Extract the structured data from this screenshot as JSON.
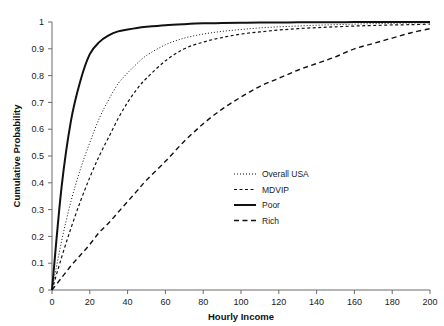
{
  "chart_data": {
    "type": "line",
    "title": "",
    "xlabel": "Hourly Income",
    "ylabel": "Cumulative Probability",
    "xlim": [
      0,
      200
    ],
    "ylim": [
      0,
      1
    ],
    "grid": false,
    "legend_position": "center-right",
    "xticks": [
      "0",
      "20",
      "40",
      "60",
      "80",
      "100",
      "120",
      "140",
      "160",
      "180",
      "200"
    ],
    "xtick_values": [
      0,
      20,
      40,
      60,
      80,
      100,
      120,
      140,
      160,
      180,
      200
    ],
    "yticks": [
      "0",
      "0.1",
      "0.2",
      "0.3",
      "0.4",
      "0.5",
      "0.6",
      "0.7",
      "0.8",
      "0.9",
      "1"
    ],
    "ytick_values": [
      0,
      0.1,
      0.2,
      0.3,
      0.4,
      0.5,
      0.6,
      0.7,
      0.8,
      0.9,
      1
    ],
    "x": [
      0,
      5,
      10,
      15,
      20,
      25,
      30,
      35,
      40,
      45,
      50,
      60,
      70,
      80,
      90,
      100,
      110,
      120,
      130,
      140,
      150,
      160,
      170,
      180,
      190,
      200
    ],
    "series": [
      {
        "name": "Overall USA",
        "style": "dotted",
        "color": "#111111",
        "width": 1.0,
        "values": [
          0,
          0.18,
          0.33,
          0.45,
          0.55,
          0.64,
          0.71,
          0.77,
          0.81,
          0.845,
          0.875,
          0.915,
          0.94,
          0.955,
          0.965,
          0.972,
          0.978,
          0.982,
          0.985,
          0.988,
          0.99,
          0.992,
          0.994,
          0.995,
          0.996,
          0.997
        ]
      },
      {
        "name": "MDVIP",
        "style": "dashed-short",
        "color": "#111111",
        "width": 1.2,
        "values": [
          0,
          0.12,
          0.23,
          0.33,
          0.42,
          0.5,
          0.57,
          0.64,
          0.7,
          0.75,
          0.79,
          0.855,
          0.9,
          0.925,
          0.942,
          0.955,
          0.963,
          0.97,
          0.975,
          0.979,
          0.982,
          0.985,
          0.987,
          0.989,
          0.99,
          0.992
        ]
      },
      {
        "name": "Poor",
        "style": "solid",
        "color": "#111111",
        "width": 2.0,
        "values": [
          0,
          0.38,
          0.63,
          0.78,
          0.88,
          0.925,
          0.95,
          0.965,
          0.972,
          0.978,
          0.982,
          0.988,
          0.992,
          0.995,
          0.996,
          0.997,
          0.998,
          0.998,
          0.999,
          0.999,
          0.999,
          1.0,
          1.0,
          1.0,
          1.0,
          1.0
        ]
      },
      {
        "name": "Rich",
        "style": "dashed-long",
        "color": "#111111",
        "width": 1.4,
        "values": [
          0,
          0.045,
          0.09,
          0.13,
          0.17,
          0.215,
          0.25,
          0.29,
          0.33,
          0.37,
          0.41,
          0.48,
          0.555,
          0.62,
          0.675,
          0.72,
          0.76,
          0.79,
          0.82,
          0.845,
          0.87,
          0.9,
          0.92,
          0.94,
          0.96,
          0.975
        ]
      }
    ],
    "legend_entries": [
      {
        "label": "Overall USA",
        "style": "dotted"
      },
      {
        "label": "MDVIP",
        "style": "dashed-short"
      },
      {
        "label": "Poor",
        "style": "solid"
      },
      {
        "label": "Rich",
        "style": "dashed-long"
      }
    ]
  }
}
